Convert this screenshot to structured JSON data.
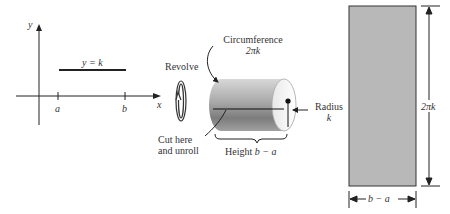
{
  "graph": {
    "y_axis_label": "y",
    "x_axis_label": "x",
    "line_label": "y = k",
    "tick_a": "a",
    "tick_b": "b"
  },
  "revolve": {
    "label": "Revolve"
  },
  "cylinder": {
    "circumference_label": "Circumference",
    "circumference_value": "2πk",
    "radius_label": "Radius",
    "radius_value": "k",
    "cut_label_line1": "Cut here",
    "cut_label_line2": "and unroll",
    "height_label": "Height",
    "height_value": "b − a"
  },
  "rectangle": {
    "height_dim": "2πk",
    "width_dim": "b − a",
    "fill_color": "#b8b8b8"
  }
}
